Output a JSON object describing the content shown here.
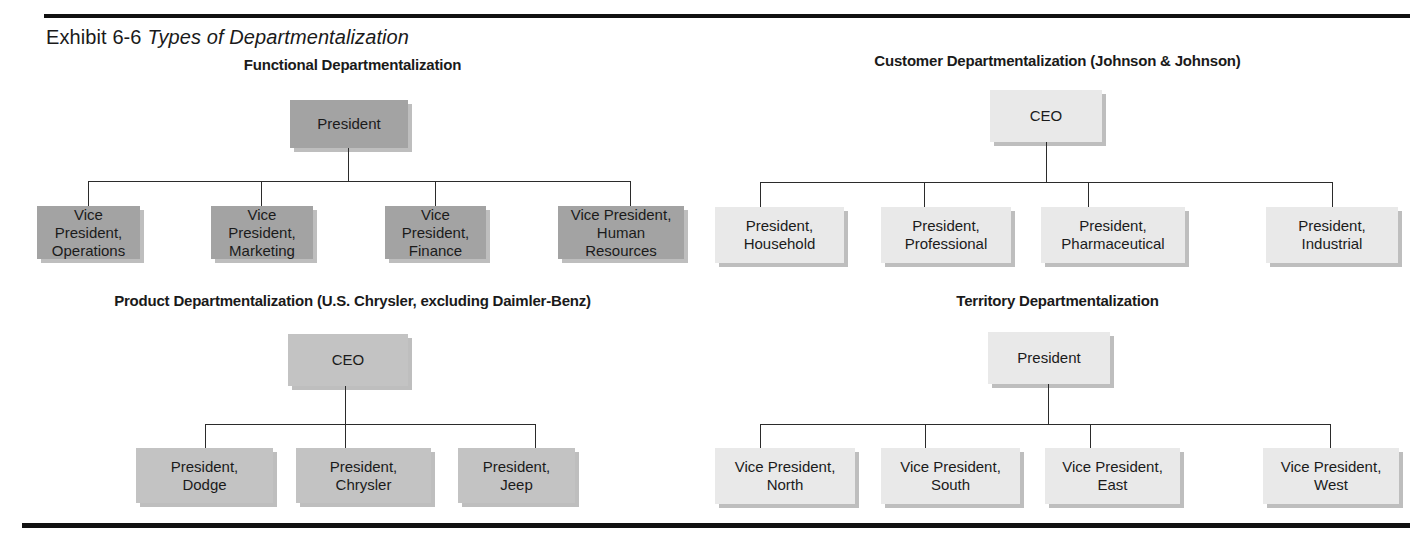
{
  "exhibit": {
    "label": "Exhibit 6-6",
    "title": "Types of Departmentalization"
  },
  "charts": {
    "functional": {
      "title": "Functional Departmentalization",
      "root": "President",
      "children": [
        "Vice President,\nOperations",
        "Vice President,\nMarketing",
        "Vice President,\nFinance",
        "Vice President,\nHuman Resources"
      ]
    },
    "customer": {
      "title": "Customer Departmentalization (Johnson & Johnson)",
      "root": "CEO",
      "children": [
        "President,\nHousehold",
        "President,\nProfessional",
        "President,\nPharmaceutical",
        "President,\nIndustrial"
      ]
    },
    "product": {
      "title": "Product Departmentalization (U.S. Chrysler, excluding Daimler-Benz)",
      "root": "CEO",
      "children": [
        "President,\nDodge",
        "President,\nChrysler",
        "President,\nJeep"
      ]
    },
    "territory": {
      "title": "Territory Departmentalization",
      "root": "President",
      "children": [
        "Vice President,\nNorth",
        "Vice President,\nSouth",
        "Vice President,\nEast",
        "Vice President,\nWest"
      ]
    }
  },
  "colors": {
    "box_dark": "#a3a3a3",
    "box_mid": "#c3c3c3",
    "box_light": "#e9e9e9",
    "rule": "#111111",
    "connector": "#2b2b2b"
  }
}
